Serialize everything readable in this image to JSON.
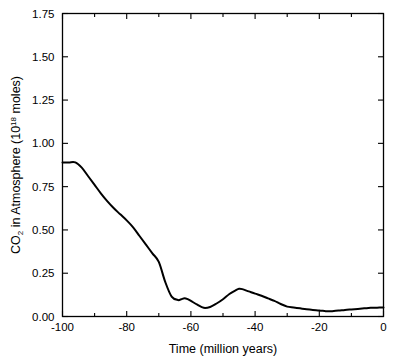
{
  "chart_data": {
    "type": "line",
    "title": "",
    "subtitle": "",
    "xlabel": "Time (million years)",
    "ylabel_prefix": "CO",
    "ylabel_sub": "2",
    "ylabel_mid": " in Atmosphere (10",
    "ylabel_sup": "18",
    "ylabel_suffix": " moles)",
    "ylabel_full": "CO2 in Atmosphere (10^18 moles)",
    "xlim": [
      -100,
      0
    ],
    "ylim": [
      0,
      1.75
    ],
    "grid": false,
    "legend": false,
    "legend_position": "none",
    "line_color": "#000000",
    "background_color": "#ffffff",
    "frame_color": "#000000",
    "x_ticks_major": [
      -100,
      -80,
      -60,
      -40,
      -20,
      0
    ],
    "x_tick_labels": [
      "-100",
      "-80",
      "-60",
      "-40",
      "-20",
      "0"
    ],
    "x_ticks_minor": [
      -90,
      -70,
      -50,
      -30,
      -10
    ],
    "y_ticks_major": [
      0.0,
      0.25,
      0.5,
      0.75,
      1.0,
      1.25,
      1.5,
      1.75
    ],
    "y_tick_labels": [
      "0.00",
      "0.25",
      "0.50",
      "0.75",
      "1.00",
      "1.25",
      "1.50",
      "1.75"
    ],
    "series": [
      {
        "name": "CO2 in Atmosphere",
        "x": [
          -100,
          -98,
          -96,
          -94,
          -92,
          -90,
          -88,
          -86,
          -84,
          -82,
          -80,
          -78,
          -76,
          -74,
          -72,
          -70,
          -68,
          -66,
          -64,
          -63,
          -62,
          -61,
          -60,
          -58,
          -56,
          -54,
          -52,
          -50,
          -48,
          -46,
          -45,
          -44,
          -42,
          -40,
          -38,
          -36,
          -34,
          -32,
          -30,
          -28,
          -26,
          -24,
          -22,
          -20,
          -18,
          -17,
          -16,
          -14,
          -12,
          -10,
          -8,
          -6,
          -4,
          -2,
          0
        ],
        "y": [
          0.89,
          0.89,
          0.89,
          0.86,
          0.81,
          0.76,
          0.71,
          0.665,
          0.625,
          0.59,
          0.555,
          0.515,
          0.465,
          0.415,
          0.365,
          0.315,
          0.2,
          0.115,
          0.095,
          0.1,
          0.105,
          0.1,
          0.09,
          0.068,
          0.05,
          0.055,
          0.075,
          0.1,
          0.13,
          0.152,
          0.16,
          0.158,
          0.145,
          0.132,
          0.12,
          0.105,
          0.09,
          0.072,
          0.057,
          0.052,
          0.047,
          0.042,
          0.038,
          0.035,
          0.031,
          0.03,
          0.031,
          0.034,
          0.038,
          0.041,
          0.044,
          0.047,
          0.05,
          0.051,
          0.052
        ]
      }
    ]
  }
}
